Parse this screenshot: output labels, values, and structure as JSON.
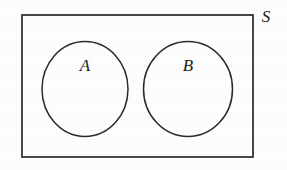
{
  "figure": {
    "kind": "venn-diagram",
    "width": 287,
    "height": 170,
    "background_color": "#fefefe",
    "stroke_color": "#2a2a2a",
    "text_color": "#1c1c1c"
  },
  "universe": {
    "label": "S",
    "shape": "rectangle",
    "x": 22,
    "y": 15,
    "width": 231,
    "height": 142,
    "label_x": 265,
    "label_y": 17
  },
  "sets": [
    {
      "label": "A",
      "shape": "ellipse",
      "cx": 85,
      "cy": 89,
      "rx": 43,
      "ry": 47.5,
      "label_x": 85,
      "label_y": 66
    },
    {
      "label": "B",
      "shape": "ellipse",
      "cx": 188,
      "cy": 89,
      "rx": 44.5,
      "ry": 47.5,
      "label_x": 188,
      "label_y": 66
    }
  ]
}
